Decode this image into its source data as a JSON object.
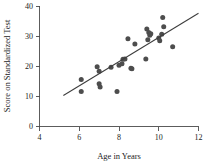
{
  "chart_data": {
    "type": "scatter",
    "title": "",
    "subtitle": "",
    "xlabel": "Age in Years",
    "ylabel": "Score on Standardized Test",
    "xlim": [
      4,
      12
    ],
    "ylim": [
      0,
      40
    ],
    "xticks": [
      4,
      6,
      8,
      10,
      12
    ],
    "yticks": [
      0,
      10,
      20,
      30,
      40
    ],
    "xtick_labels": [
      "4",
      "6",
      "8",
      "10",
      "12"
    ],
    "ytick_labels": [
      "0",
      "10",
      "20",
      "30",
      "40"
    ],
    "grid": false,
    "legend": null,
    "marker_color": "#4d4d4d",
    "line_color": "#3d3d3d",
    "axis_color": "#4a4a4a",
    "points": [
      {
        "x": 6.1,
        "y": 15.6
      },
      {
        "x": 6.1,
        "y": 11.6
      },
      {
        "x": 6.9,
        "y": 19.8
      },
      {
        "x": 7.0,
        "y": 18.3
      },
      {
        "x": 7.0,
        "y": 14.2
      },
      {
        "x": 7.05,
        "y": 13.1
      },
      {
        "x": 7.6,
        "y": 19.7
      },
      {
        "x": 7.9,
        "y": 11.6
      },
      {
        "x": 8.0,
        "y": 20.3
      },
      {
        "x": 8.15,
        "y": 20.8
      },
      {
        "x": 8.2,
        "y": 22.3
      },
      {
        "x": 8.3,
        "y": 22.4
      },
      {
        "x": 8.45,
        "y": 29.1
      },
      {
        "x": 8.6,
        "y": 19.3
      },
      {
        "x": 8.65,
        "y": 19.2
      },
      {
        "x": 8.8,
        "y": 27.4
      },
      {
        "x": 9.35,
        "y": 22.4
      },
      {
        "x": 9.4,
        "y": 32.4
      },
      {
        "x": 9.45,
        "y": 28.8
      },
      {
        "x": 9.5,
        "y": 31.2
      },
      {
        "x": 9.55,
        "y": 30.3
      },
      {
        "x": 9.6,
        "y": 30.8
      },
      {
        "x": 10.0,
        "y": 29.4
      },
      {
        "x": 10.05,
        "y": 28.5
      },
      {
        "x": 10.15,
        "y": 30.6
      },
      {
        "x": 10.2,
        "y": 36.2
      },
      {
        "x": 10.25,
        "y": 33.1
      },
      {
        "x": 10.7,
        "y": 26.5
      }
    ],
    "fit_line": {
      "label": "",
      "x_start": 5.2,
      "y_start": 10.3,
      "x_end": 12.0,
      "y_end": 37.6
    }
  },
  "axes": {
    "x_axis_name": "Age in Years",
    "y_axis_name": "Score on Standardized Test"
  }
}
